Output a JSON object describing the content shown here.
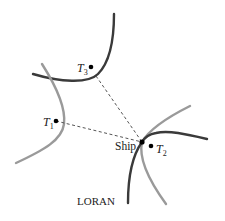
{
  "diagram": {
    "title": "LORAN",
    "colors": {
      "dark_curve": "#3a3a3a",
      "light_curve": "#9a9a9a",
      "dashed_line": "#555555",
      "point": "#000000",
      "background": "#ffffff"
    },
    "points": [
      {
        "id": "T1",
        "label_main": "T",
        "label_sub": "1",
        "x": 56,
        "y": 121
      },
      {
        "id": "T2",
        "label_main": "T",
        "label_sub": "2",
        "x": 151,
        "y": 146
      },
      {
        "id": "T3",
        "label_main": "T",
        "label_sub": "3",
        "x": 91,
        "y": 67
      },
      {
        "id": "Ship",
        "label_main": "Ship",
        "x": 142,
        "y": 142
      }
    ],
    "dashed_lines": [
      {
        "from": "T1",
        "to": "Ship"
      },
      {
        "from": "T3",
        "to": "Ship"
      }
    ],
    "curves": [
      {
        "name": "hyperbola-dark-top",
        "shade": "dark"
      },
      {
        "name": "hyperbola-light-left",
        "shade": "light"
      },
      {
        "name": "hyperbola-dark-right-upper",
        "shade": "dark"
      },
      {
        "name": "hyperbola-dark-right-lower",
        "shade": "dark"
      },
      {
        "name": "hyperbola-light-right-upper",
        "shade": "light"
      },
      {
        "name": "hyperbola-light-right-lower",
        "shade": "light"
      }
    ]
  }
}
